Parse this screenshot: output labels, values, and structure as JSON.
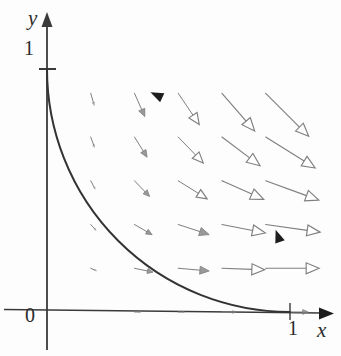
{
  "figure": {
    "kind": "vector-field-with-oriented-curve",
    "background_color": "#fdfdfd",
    "axis_color": "#3a3a3a",
    "curve_color": "#333333",
    "vector_color": "#7f7f7f",
    "text_color": "#2b2b2b"
  },
  "axes": {
    "x_axis_label": "x",
    "y_axis_label": "y",
    "origin_label": "0",
    "x_tick_label": "1",
    "y_tick_label": "1",
    "origin_px": {
      "x": 47,
      "y": 312
    },
    "unit_px": 243,
    "x_axis_arrow": "solid",
    "y_axis_arrow": "solid"
  },
  "chart_data": {
    "type": "scatter",
    "title": "",
    "xlabel": "x",
    "ylabel": "y",
    "xlim": [
      0,
      1.2
    ],
    "ylim": [
      0,
      1.2
    ],
    "grid": false,
    "legend": null,
    "curve": {
      "name": "unit quarter circle",
      "equation": "x^2 + y^2 = 1",
      "radius": 1,
      "start": [
        0,
        1
      ],
      "end": [
        1,
        0
      ],
      "orientation": "counterclockwise",
      "arrowheads_at_t": [
        0.28,
        0.78
      ]
    },
    "field": {
      "name": "vector field",
      "grid_x": [
        0.18,
        0.36,
        0.54,
        0.72,
        0.9
      ],
      "grid_y": [
        0.18,
        0.36,
        0.54,
        0.72,
        0.9
      ],
      "vectors": [
        {
          "x": 0.18,
          "y": 0.9,
          "angle_deg": -74,
          "length": 0.055
        },
        {
          "x": 0.36,
          "y": 0.9,
          "angle_deg": -66,
          "length": 0.105
        },
        {
          "x": 0.54,
          "y": 0.9,
          "angle_deg": -56,
          "length": 0.155
        },
        {
          "x": 0.72,
          "y": 0.9,
          "angle_deg": -49,
          "length": 0.205
        },
        {
          "x": 0.9,
          "y": 0.9,
          "angle_deg": -45,
          "length": 0.25
        },
        {
          "x": 0.18,
          "y": 0.72,
          "angle_deg": -70,
          "length": 0.048
        },
        {
          "x": 0.36,
          "y": 0.72,
          "angle_deg": -58,
          "length": 0.098
        },
        {
          "x": 0.54,
          "y": 0.72,
          "angle_deg": -46,
          "length": 0.148
        },
        {
          "x": 0.72,
          "y": 0.72,
          "angle_deg": -37,
          "length": 0.196
        },
        {
          "x": 0.9,
          "y": 0.72,
          "angle_deg": -32,
          "length": 0.24
        },
        {
          "x": 0.18,
          "y": 0.54,
          "angle_deg": -62,
          "length": 0.042
        },
        {
          "x": 0.36,
          "y": 0.54,
          "angle_deg": -46,
          "length": 0.09
        },
        {
          "x": 0.54,
          "y": 0.54,
          "angle_deg": -32,
          "length": 0.14
        },
        {
          "x": 0.72,
          "y": 0.54,
          "angle_deg": -24,
          "length": 0.188
        },
        {
          "x": 0.9,
          "y": 0.54,
          "angle_deg": -20,
          "length": 0.232
        },
        {
          "x": 0.18,
          "y": 0.36,
          "angle_deg": -48,
          "length": 0.036
        },
        {
          "x": 0.36,
          "y": 0.36,
          "angle_deg": -30,
          "length": 0.084
        },
        {
          "x": 0.54,
          "y": 0.36,
          "angle_deg": -18,
          "length": 0.134
        },
        {
          "x": 0.72,
          "y": 0.36,
          "angle_deg": -11,
          "length": 0.182
        },
        {
          "x": 0.9,
          "y": 0.36,
          "angle_deg": -8,
          "length": 0.226
        },
        {
          "x": 0.18,
          "y": 0.18,
          "angle_deg": -24,
          "length": 0.03
        },
        {
          "x": 0.36,
          "y": 0.18,
          "angle_deg": -12,
          "length": 0.078
        },
        {
          "x": 0.54,
          "y": 0.18,
          "angle_deg": -5,
          "length": 0.128
        },
        {
          "x": 0.72,
          "y": 0.18,
          "angle_deg": -2,
          "length": 0.176
        },
        {
          "x": 0.9,
          "y": 0.18,
          "angle_deg": 0,
          "length": 0.22
        }
      ],
      "on_axis_vectors": [
        {
          "x": 0.36,
          "y": 0.0,
          "angle_deg": 0,
          "length": 0.03
        },
        {
          "x": 0.54,
          "y": 0.0,
          "angle_deg": 0,
          "length": 0.03
        },
        {
          "x": 0.72,
          "y": 0.0,
          "angle_deg": 0,
          "length": 0.06
        },
        {
          "x": 1.0,
          "y": 0.0,
          "angle_deg": 0,
          "length": 0.075
        }
      ],
      "arrowhead_style": "hollow-triangle",
      "magnitude_note": "arrow length increases with distance from origin",
      "direction_note": "direction rotates from downward near the y-axis to rightward near the x-axis"
    }
  }
}
